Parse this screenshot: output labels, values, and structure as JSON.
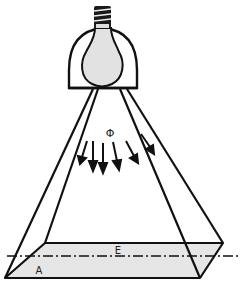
{
  "diagram": {
    "type": "illumination-diagram",
    "labels": {
      "flux": "Φ",
      "illuminance": "E",
      "area": "A"
    },
    "colors": {
      "stroke": "#111111",
      "bulb_fill": "#e2e2e2",
      "surface_fill": "#e6e6e6",
      "background": "#ffffff"
    },
    "flux_arrow_count": 6
  }
}
